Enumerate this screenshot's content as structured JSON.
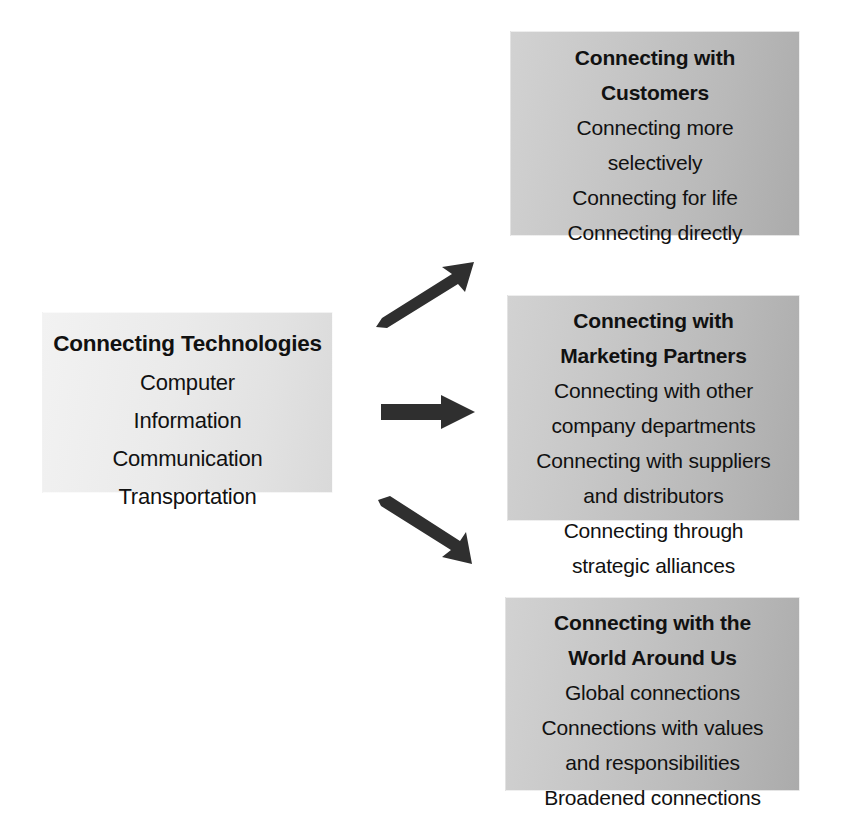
{
  "diagram": {
    "colors": {
      "page_background": "#ffffff",
      "source_card_fill": "#eaeaea",
      "target_card_fill": "#c2c2c2",
      "arrow_fill": "#2f2f2f",
      "text": "#111111"
    },
    "source": {
      "heading": "Connecting Technologies",
      "items": [
        "Computer",
        "Information",
        "Communication",
        "Transportation"
      ]
    },
    "targets": [
      {
        "heading_line_1": "Connecting with",
        "heading_line_2": "Customers",
        "items": [
          {
            "line_1": "Connecting more",
            "line_2": "selectively"
          },
          {
            "line_1": "Connecting for life",
            "line_2": ""
          },
          {
            "line_1": "Connecting directly",
            "line_2": ""
          }
        ]
      },
      {
        "heading_line_1": "Connecting with",
        "heading_line_2": "Marketing Partners",
        "items": [
          {
            "line_1": "Connecting with other",
            "line_2": "company departments"
          },
          {
            "line_1": "Connecting with suppliers",
            "line_2": "and distributors"
          },
          {
            "line_1": "Connecting through",
            "line_2": "strategic alliances"
          }
        ]
      },
      {
        "heading_line_1": "Connecting with the",
        "heading_line_2": "World Around Us",
        "items": [
          {
            "line_1": "Global connections",
            "line_2": ""
          },
          {
            "line_1": "Connections with values",
            "line_2": "and responsibilities"
          },
          {
            "line_1": "Broadened connections",
            "line_2": ""
          }
        ]
      }
    ],
    "connectors": [
      {
        "name": "arrow-up-right",
        "from": "Connecting Technologies",
        "to": "Connecting with Customers"
      },
      {
        "name": "arrow-right",
        "from": "Connecting Technologies",
        "to": "Connecting with Marketing Partners"
      },
      {
        "name": "arrow-down-right",
        "from": "Connecting Technologies",
        "to": "Connecting with the World Around Us"
      }
    ]
  }
}
